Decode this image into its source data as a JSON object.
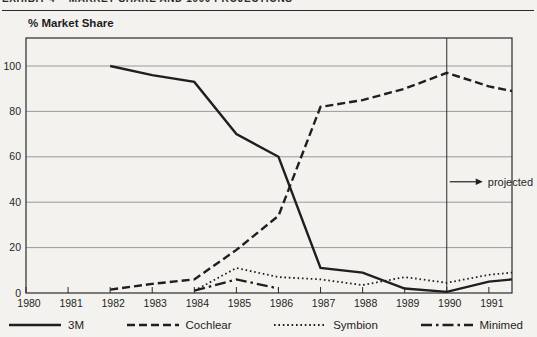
{
  "header": {
    "exhibit_line": "EXHIBIT 4    MARKET SHARE AND 1990 PROJECTIONS"
  },
  "chart_data": {
    "type": "line",
    "title": "% Market Share",
    "x_tick_labels": [
      "1980",
      "1981",
      "1982",
      "1983",
      "1984",
      "1985",
      "1986",
      "1987",
      "1988",
      "1989",
      "1990",
      "1991"
    ],
    "y_tick_labels": [
      "0",
      "20",
      "40",
      "60",
      "80",
      "100"
    ],
    "y_ticks": [
      0,
      20,
      40,
      60,
      80,
      100
    ],
    "ylim": [
      0,
      112
    ],
    "grid": "horizontal",
    "legend_position": "bottom",
    "series": [
      {
        "name": "3M",
        "style": "solid",
        "points": [
          [
            1982,
            100
          ],
          [
            1983,
            96
          ],
          [
            1984,
            93
          ],
          [
            1985,
            70
          ],
          [
            1986,
            60
          ],
          [
            1987,
            11
          ],
          [
            1988,
            9
          ],
          [
            1989,
            2
          ],
          [
            1990,
            0.5
          ],
          [
            1991,
            5
          ]
        ],
        "edge_value": 6
      },
      {
        "name": "Cochlear",
        "style": "dashed",
        "points": [
          [
            1982,
            1.5
          ],
          [
            1983,
            4
          ],
          [
            1984,
            6
          ],
          [
            1985,
            19
          ],
          [
            1986,
            34
          ],
          [
            1987,
            82
          ],
          [
            1988,
            85
          ],
          [
            1989,
            90
          ],
          [
            1990,
            97
          ],
          [
            1991,
            91
          ]
        ],
        "edge_value": 89
      },
      {
        "name": "Symbion",
        "style": "dotted",
        "points": [
          [
            1984,
            1
          ],
          [
            1985,
            11
          ],
          [
            1986,
            7
          ],
          [
            1987,
            6
          ],
          [
            1988,
            3.5
          ],
          [
            1989,
            7
          ],
          [
            1990,
            4.5
          ],
          [
            1991,
            8
          ]
        ],
        "edge_value": 9
      },
      {
        "name": "Minimed",
        "style": "dashdot",
        "points": [
          [
            1984,
            1
          ],
          [
            1985,
            6
          ],
          [
            1986,
            2
          ]
        ]
      }
    ],
    "annotations": {
      "projected": {
        "label": "projected",
        "year": 1990,
        "y_value": 49
      }
    }
  },
  "colors": {
    "ink": "#1f1f1f",
    "grid": "#8f8f8f",
    "border": "#2a2a2a",
    "background": "#f4f2ee"
  }
}
